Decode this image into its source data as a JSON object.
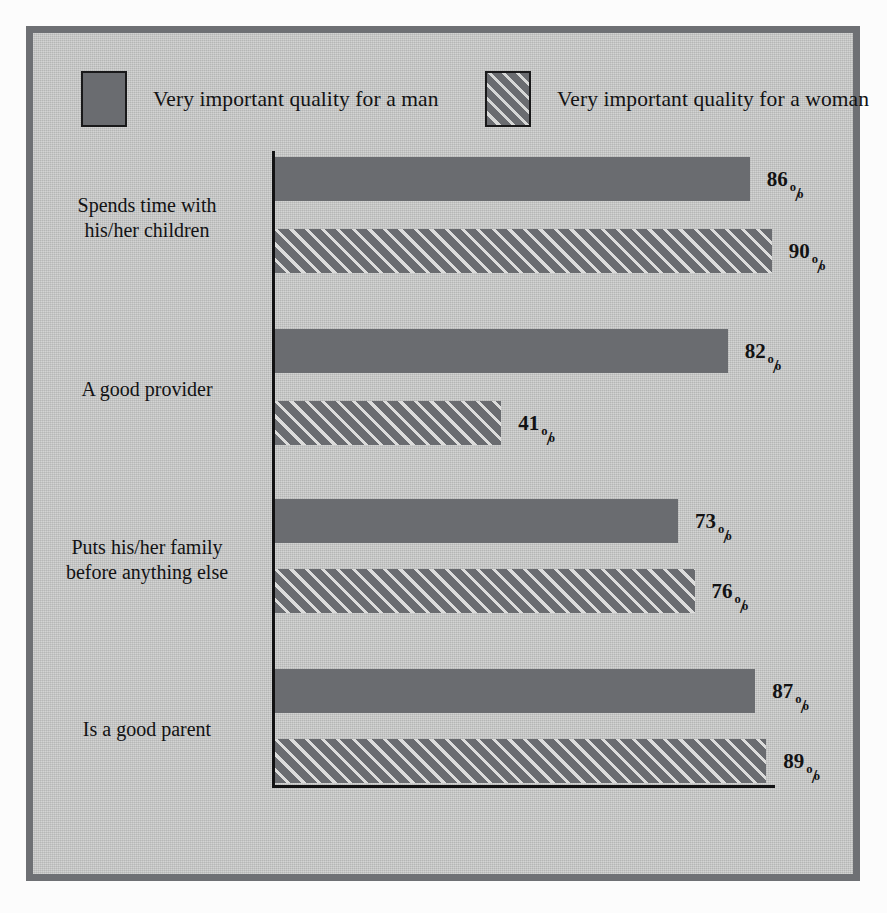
{
  "legend": {
    "entries": [
      {
        "label": "Very important quality for a man",
        "style": "solid",
        "swatch_color": "#6a6c70"
      },
      {
        "label": "Very important quality for a woman",
        "style": "hatched",
        "swatch_color": "#6a6c70"
      }
    ]
  },
  "colors": {
    "bar_fill": "#6a6c70",
    "hatch_line": "#dcdcdb",
    "plate_background": "#c6c7c6",
    "frame_border": "#6e7074",
    "page_background": "#fcfcfc",
    "axis": "#121213",
    "text": "#121213"
  },
  "chart_data": {
    "type": "bar",
    "orientation": "horizontal",
    "title": "",
    "subtitle": "",
    "xlabel": "",
    "ylabel": "",
    "xlim": [
      0,
      100
    ],
    "grid": false,
    "legend_position": "top",
    "value_suffix": "%",
    "categories": [
      "Spends time with his/her children",
      "A good provider",
      "Puts his/her family before anything else",
      "Is a good parent"
    ],
    "category_lines": [
      [
        "Spends time with",
        "his/her children"
      ],
      [
        "A good provider"
      ],
      [
        "Puts his/her family",
        "before anything else"
      ],
      [
        "Is a good parent"
      ]
    ],
    "series": [
      {
        "name": "Very important quality for a man",
        "style": "solid",
        "values": [
          86,
          82,
          73,
          87
        ]
      },
      {
        "name": "Very important quality for a woman",
        "style": "hatched",
        "values": [
          90,
          41,
          76,
          89
        ]
      }
    ],
    "value_labels": {
      "man": [
        "86",
        "82",
        "73",
        "87"
      ],
      "woman": [
        "90",
        "41",
        "76",
        "89"
      ]
    }
  },
  "groups": [
    {
      "line1": "Spends time with",
      "line2": "his/her children",
      "man": {
        "value": 86,
        "label": "86"
      },
      "woman": {
        "value": 90,
        "label": "90"
      }
    },
    {
      "line1": "A good provider",
      "line2": "",
      "man": {
        "value": 82,
        "label": "82"
      },
      "woman": {
        "value": 41,
        "label": "41"
      }
    },
    {
      "line1": "Puts his/her family",
      "line2": "before anything else",
      "man": {
        "value": 73,
        "label": "73"
      },
      "woman": {
        "value": 76,
        "label": "76"
      }
    },
    {
      "line1": "Is a good parent",
      "line2": "",
      "man": {
        "value": 87,
        "label": "87"
      },
      "woman": {
        "value": 89,
        "label": "89"
      }
    }
  ]
}
